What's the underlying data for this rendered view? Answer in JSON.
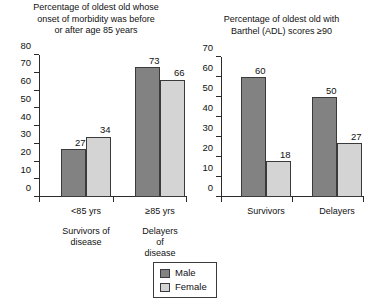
{
  "chart_data": [
    {
      "type": "bar",
      "id": "left",
      "title": "Percentage of oldest old whose onset of morbidity was before or after age 85 years",
      "title_lines": [
        "Percentage of oldest old whose",
        "onset of morbidity was before",
        "or after age 85 years"
      ],
      "categories": [
        "<85 yrs",
        "≥85 yrs"
      ],
      "group_labels": [
        [
          "Survivors of",
          "disease"
        ],
        [
          "Delayers of",
          "disease"
        ]
      ],
      "series": [
        {
          "name": "Male",
          "values": [
            27,
            73
          ],
          "color": "#828282"
        },
        {
          "name": "Female",
          "values": [
            34,
            66
          ],
          "color": "#d4d4d4"
        }
      ],
      "ylim": [
        0,
        80
      ],
      "yticks": [
        0,
        10,
        20,
        30,
        40,
        50,
        60,
        70,
        80
      ],
      "xlabel": "",
      "ylabel": "",
      "grid": false
    },
    {
      "type": "bar",
      "id": "right",
      "title": "Percentage of oldest old with Barthel (ADL) scores ≥90",
      "title_lines": [
        "Percentage of oldest old with",
        "Barthel (ADL) scores ≥90"
      ],
      "categories": [
        "Survivors",
        "Delayers"
      ],
      "group_labels": [
        [
          ""
        ],
        [
          ""
        ]
      ],
      "series": [
        {
          "name": "Male",
          "values": [
            60,
            50
          ],
          "color": "#828282"
        },
        {
          "name": "Female",
          "values": [
            18,
            27
          ],
          "color": "#d4d4d4"
        }
      ],
      "ylim": [
        0,
        70
      ],
      "yticks": [
        0,
        10,
        20,
        30,
        40,
        50,
        60,
        70
      ],
      "xlabel": "",
      "ylabel": "",
      "grid": false
    }
  ],
  "legend": {
    "position": "bottom-center",
    "items": [
      {
        "label": "Male",
        "color": "#828282"
      },
      {
        "label": "Female",
        "color": "#d4d4d4"
      }
    ]
  }
}
